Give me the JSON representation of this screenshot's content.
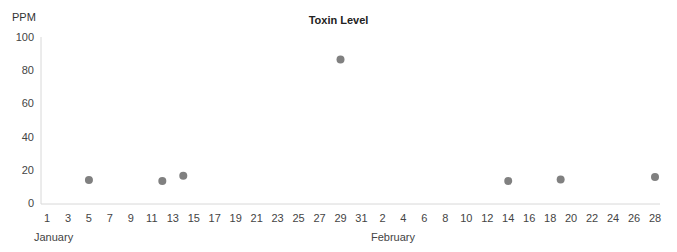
{
  "chart_data": {
    "type": "scatter",
    "title": "Toxin Level",
    "xlabel": "",
    "ylabel": "PPM",
    "ylim": [
      0,
      100
    ],
    "yticks": [
      0,
      20,
      40,
      60,
      80,
      100
    ],
    "grid": false,
    "xticks": [
      "1",
      "3",
      "5",
      "7",
      "9",
      "11",
      "13",
      "15",
      "17",
      "19",
      "21",
      "23",
      "25",
      "27",
      "29",
      "31",
      "2",
      "4",
      "6",
      "8",
      "10",
      "12",
      "14",
      "16",
      "18",
      "20",
      "22",
      "24",
      "26",
      "28"
    ],
    "month_labels": [
      "January",
      "February"
    ],
    "series": [
      {
        "name": "Toxin Level",
        "color": "#808080",
        "points": [
          {
            "date": "January 5",
            "value": 14.5
          },
          {
            "date": "January 12",
            "value": 13.8
          },
          {
            "date": "January 14",
            "value": 17
          },
          {
            "date": "January 29",
            "value": 87
          },
          {
            "date": "February 14",
            "value": 13.8
          },
          {
            "date": "February 19",
            "value": 14.7
          },
          {
            "date": "February 28",
            "value": 16.3
          }
        ]
      }
    ]
  }
}
